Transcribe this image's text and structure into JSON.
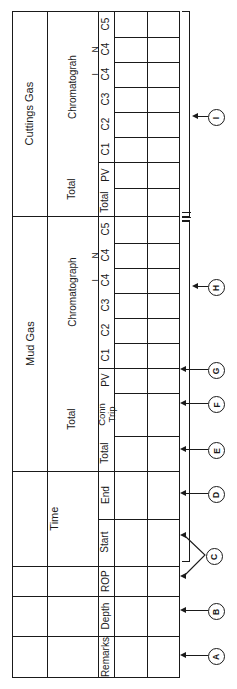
{
  "form": {
    "title": "Mud logging / gas data form (rotated field sheet)",
    "groups": [
      {
        "id": "cuttings_gas",
        "label": "Cuttings Gas"
      },
      {
        "id": "mud_gas",
        "label": "Mud Gas"
      },
      {
        "id": "time",
        "label": "Time"
      }
    ],
    "subgroups": {
      "chromatograph": "Chromatograh",
      "chromatograph2": "Chromatograph",
      "total": "Total",
      "total2": "Total"
    },
    "cuttings_gas_rows": [
      {
        "label": "C5"
      },
      {
        "label": "C4",
        "sup": "N"
      },
      {
        "label": "C4",
        "sup": "I"
      },
      {
        "label": "C3"
      },
      {
        "label": "C2"
      },
      {
        "label": "C1"
      },
      {
        "label": "PV"
      },
      {
        "label": "Total"
      }
    ],
    "mud_gas_rows": [
      {
        "label": "C5"
      },
      {
        "label": "C4",
        "sup": "N"
      },
      {
        "label": "C4",
        "sup": "I"
      },
      {
        "label": "C3"
      },
      {
        "label": "C2"
      },
      {
        "label": "C1"
      },
      {
        "label": "PV"
      },
      {
        "label": "Conn Trip"
      },
      {
        "label": "Total"
      }
    ],
    "time_rows": [
      {
        "label": "End"
      },
      {
        "label": "Start"
      }
    ],
    "bottom_rows": [
      {
        "label": "ROP"
      },
      {
        "label": "Depth"
      },
      {
        "label": "Remarks"
      }
    ],
    "markers": [
      {
        "id": "A",
        "label": "A"
      },
      {
        "id": "B",
        "label": "B"
      },
      {
        "id": "C",
        "label": "C"
      },
      {
        "id": "D",
        "label": "D"
      },
      {
        "id": "E",
        "label": "E"
      },
      {
        "id": "F",
        "label": "F"
      },
      {
        "id": "G",
        "label": "G"
      },
      {
        "id": "H",
        "label": "H"
      },
      {
        "id": "I",
        "label": "I"
      }
    ],
    "colors": {
      "ink": "#1a1a1a",
      "paper": "#ffffff"
    }
  }
}
